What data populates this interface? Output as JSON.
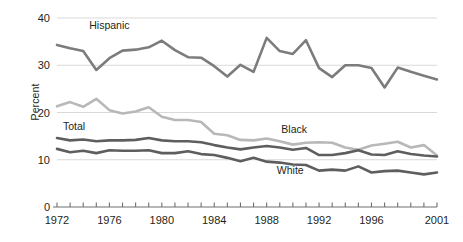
{
  "chart_data": {
    "type": "line",
    "title": "",
    "xlabel": "",
    "ylabel": "Percent",
    "ylim": [
      0,
      40
    ],
    "yticks": [
      0,
      10,
      20,
      30,
      40
    ],
    "xlim": [
      1972,
      2001
    ],
    "grid": true,
    "grid_axis": "y",
    "legend": "inline-annotations",
    "x": [
      1972,
      1973,
      1974,
      1975,
      1976,
      1977,
      1978,
      1979,
      1980,
      1981,
      1982,
      1983,
      1984,
      1985,
      1986,
      1987,
      1988,
      1989,
      1990,
      1991,
      1992,
      1993,
      1994,
      1995,
      1996,
      1997,
      1998,
      1999,
      2000,
      2001
    ],
    "xtick_labels": [
      "1972",
      "1976",
      "1980",
      "1984",
      "1988",
      "1992",
      "1996",
      "2001"
    ],
    "xtick_label_years": [
      1972,
      1976,
      1980,
      1984,
      1988,
      1992,
      1996,
      2001
    ],
    "series": [
      {
        "name": "Hispanic",
        "color": "#7c7c7c",
        "width": 2.6,
        "label_x": 1976.0,
        "label_y": 37.6,
        "values": [
          34.3,
          33.6,
          33.0,
          29.0,
          31.5,
          33.1,
          33.3,
          33.8,
          35.2,
          33.2,
          31.7,
          31.6,
          29.8,
          27.6,
          30.1,
          28.6,
          35.8,
          33.0,
          32.4,
          35.3,
          29.4,
          27.5,
          30.0,
          30.0,
          29.4,
          25.3,
          29.5,
          28.6,
          27.8,
          27.0
        ]
      },
      {
        "name": "Black",
        "color": "#b8b8b8",
        "width": 2.6,
        "label_x": 1990.1,
        "label_y": 15.6,
        "values": [
          21.3,
          22.2,
          21.2,
          22.9,
          20.5,
          19.8,
          20.2,
          21.1,
          19.1,
          18.4,
          18.4,
          18.0,
          15.5,
          15.2,
          14.2,
          14.1,
          14.5,
          13.9,
          13.2,
          13.6,
          13.7,
          13.6,
          12.6,
          12.1,
          13.0,
          13.4,
          13.8,
          12.6,
          13.1,
          10.9
        ]
      },
      {
        "name": "Total",
        "color": "#5e5e5e",
        "width": 2.6,
        "label_x": 1973.3,
        "label_y": 16.2,
        "values": [
          14.6,
          14.1,
          14.3,
          13.9,
          14.1,
          14.1,
          14.2,
          14.6,
          14.1,
          13.9,
          13.9,
          13.7,
          13.1,
          12.6,
          12.2,
          12.6,
          12.9,
          12.6,
          12.1,
          12.5,
          11.0,
          11.0,
          11.4,
          12.0,
          11.1,
          11.0,
          11.8,
          11.2,
          10.9,
          10.7
        ]
      },
      {
        "name": "White",
        "color": "#5e5e5e",
        "width": 2.6,
        "label_x": 1989.8,
        "label_y": 7.0,
        "values": [
          12.3,
          11.6,
          11.9,
          11.4,
          12.0,
          11.9,
          11.9,
          12.0,
          11.4,
          11.4,
          11.8,
          11.2,
          11.0,
          10.4,
          9.7,
          10.4,
          9.6,
          9.4,
          9.0,
          8.9,
          7.7,
          7.9,
          7.7,
          8.6,
          7.3,
          7.6,
          7.7,
          7.3,
          6.9,
          7.3
        ]
      }
    ]
  },
  "axis": {
    "y_title": "Percent",
    "y_tick_0": "0",
    "y_tick_10": "10",
    "y_tick_20": "20",
    "y_tick_30": "30",
    "y_tick_40": "40"
  },
  "annotations": {
    "hispanic": "Hispanic",
    "black": "Black",
    "total": "Total",
    "white": "White"
  },
  "style": {
    "background": "#ffffff",
    "grid_color": "#d9d9d9",
    "axis_color": "#6f6f6f",
    "text_color": "#231f20",
    "hispanic_color": "#7c7c7c",
    "black_color": "#b8b8b8",
    "total_color": "#5e5e5e",
    "white_color": "#5e5e5e"
  }
}
